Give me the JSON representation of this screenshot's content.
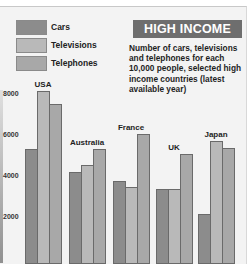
{
  "header": {
    "title": "HIGH INCOME",
    "subtitle": "Number of cars, televisions and telephones for each 10,000 people, selected high income countries (latest available year)"
  },
  "legend": [
    {
      "label": "Cars",
      "color": "#8c8c8c"
    },
    {
      "label": "Televisions",
      "color": "#b9b9b9"
    },
    {
      "label": "Telephones",
      "color": "#a8a8a8"
    }
  ],
  "axis": {
    "ticks": [
      "8000",
      "6000",
      "4000",
      "2000"
    ]
  },
  "countries": [
    "USA",
    "Australia",
    "France",
    "UK",
    "Japan"
  ],
  "chart_data": {
    "type": "bar",
    "title": "HIGH INCOME",
    "subtitle": "Number of cars, televisions and telephones for each 10,000 people, selected high income countries (latest available year)",
    "categories": [
      "USA",
      "Australia",
      "France",
      "UK",
      "Japan"
    ],
    "series": [
      {
        "name": "Cars",
        "values": [
          5300,
          4200,
          3750,
          3350,
          2150
        ]
      },
      {
        "name": "Televisions",
        "values": [
          8150,
          4550,
          3450,
          3350,
          5700
        ]
      },
      {
        "name": "Telephones",
        "values": [
          7500,
          5300,
          6050,
          5050,
          5350
        ]
      }
    ],
    "xlabel": "",
    "ylabel": "",
    "yticks": [
      2000,
      4000,
      6000,
      8000
    ],
    "ylim": [
      0,
      8500
    ],
    "grid": false,
    "legend_position": "top-left"
  }
}
